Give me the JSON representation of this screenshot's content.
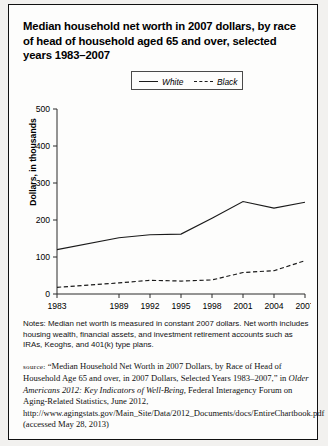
{
  "title": "Median household net worth in 2007 dollars, by race of head of household aged 65 and over, selected years 1983–2007",
  "legend": {
    "white_label": "White",
    "black_label": "Black"
  },
  "axis": {
    "ylabel": "Dollars, in thousands"
  },
  "notes": {
    "label": "Notes:",
    "text": " Median net worth is measured in constant 2007 dollars. Net worth includes housing wealth, financial assets, and investment retirement accounts such as IRAs, Keoghs, and 401(k) type plans."
  },
  "source": {
    "label": "source:",
    "part1": " “Median Household Net Worth in 2007 Dollars, by Race of Head of Household Age 65 and over, in 2007 Dollars, Selected Years 1983–2007,” in ",
    "italic_title": "Older Americans 2012: Key Indicators of Well-Being,",
    "part2": " Federal Interagency Forum on Aging-Related Statistics, June 2012, http://www.agingstats.gov/Main_Site/Data/2012_Documents/docs/EntireChartbook.pdf (accessed May 28, 2013)"
  },
  "chart_data": {
    "type": "line",
    "title": "Median household net worth in 2007 dollars, by race of head of household aged 65 and over, selected years 1983–2007",
    "xlabel": "",
    "ylabel": "Dollars, in thousands",
    "x": [
      1983,
      1989,
      1992,
      1995,
      1998,
      2001,
      2004,
      2007
    ],
    "xticklabels": [
      "1983",
      "1989",
      "1992",
      "1995",
      "1998",
      "2001",
      "2004",
      "2007"
    ],
    "yticklabels": [
      "0",
      "100",
      "200",
      "300",
      "400",
      "500"
    ],
    "yticks": [
      0,
      100,
      200,
      300,
      400,
      500
    ],
    "ylim": [
      0,
      500
    ],
    "xlim": [
      1983,
      2007
    ],
    "grid": false,
    "legend_position": "top-center",
    "series": [
      {
        "name": "White",
        "style": "solid",
        "color": "#1a1a1a",
        "values": [
          120,
          152,
          160,
          162,
          205,
          250,
          232,
          248
        ]
      },
      {
        "name": "Black",
        "style": "dashed",
        "color": "#1a1a1a",
        "values": [
          18,
          30,
          37,
          35,
          38,
          58,
          63,
          90
        ]
      }
    ]
  }
}
